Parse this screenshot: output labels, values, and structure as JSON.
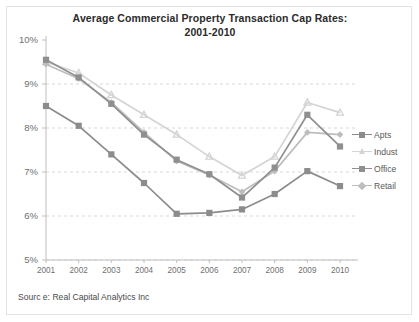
{
  "chart_data": {
    "type": "line",
    "title": "Average Commercial Property Transaction Cap Rates: 2001-2010",
    "title_line1": "Average Commercial Property Transaction Cap Rates:",
    "title_line2": "2001-2010",
    "xlabel": "",
    "ylabel": "",
    "categories": [
      "2001",
      "2002",
      "2003",
      "2004",
      "2005",
      "2006",
      "2007",
      "2008",
      "2009",
      "2010"
    ],
    "ylim": [
      5,
      10
    ],
    "ytick_labels": [
      "10%",
      "9%",
      "8%",
      "7%",
      "6%",
      "5%"
    ],
    "ytick_values": [
      10,
      9,
      8,
      7,
      6,
      5
    ],
    "grid": true,
    "legend_position": "right",
    "series": [
      {
        "name": "Apts",
        "color": "#8c8c8c",
        "marker": "square",
        "values": [
          8.5,
          8.05,
          7.4,
          6.75,
          6.05,
          6.07,
          6.15,
          6.5,
          7.02,
          6.68
        ]
      },
      {
        "name": "Indust",
        "color": "#d4d4d4",
        "marker": "triangle",
        "values": [
          9.5,
          9.25,
          8.75,
          8.3,
          7.85,
          7.35,
          6.92,
          7.35,
          8.58,
          8.35
        ]
      },
      {
        "name": "Office",
        "color": "#8f8f8f",
        "marker": "square",
        "values": [
          9.55,
          9.15,
          8.55,
          7.85,
          7.28,
          6.95,
          6.42,
          7.1,
          8.3,
          7.58
        ]
      },
      {
        "name": "Retail",
        "color": "#bdbdbd",
        "marker": "diamond",
        "values": [
          9.45,
          9.12,
          8.58,
          7.9,
          7.25,
          6.93,
          6.55,
          7.02,
          7.9,
          7.85
        ]
      }
    ],
    "source_note": "Sourc e: Real Capital Analytics Inc"
  },
  "colors": {
    "axis": "#bfbfbf",
    "grid": "#ded5d0",
    "text": "#6f6f6f",
    "title": "#2b2b2b",
    "border": "#e3e3e3",
    "background": "#ffffff"
  }
}
